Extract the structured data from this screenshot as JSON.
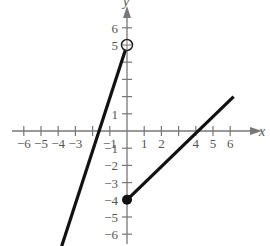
{
  "chart_data": {
    "type": "line",
    "title": "",
    "xlabel": "x",
    "ylabel": "y",
    "xlim": [
      -6.5,
      7
    ],
    "ylim": [
      -6.7,
      7
    ],
    "x_ticks": [
      -6,
      -5,
      -4,
      -3,
      -2,
      -1,
      1,
      2,
      3,
      4,
      5,
      6
    ],
    "x_tick_labels": [
      "-6",
      "-5",
      "-4",
      "-3",
      "",
      "-1",
      "1",
      "2",
      "",
      "4",
      "5",
      "6"
    ],
    "y_ticks": [
      -6,
      -5,
      -4,
      -3,
      -2,
      -1,
      1,
      2,
      3,
      4,
      5,
      6
    ],
    "y_tick_labels": [
      "-6",
      "-5",
      "-4",
      "-3",
      "-2",
      "-1",
      "1",
      "",
      "",
      "",
      "5",
      "6"
    ],
    "series": [
      {
        "name": "left piece",
        "x": [
          -3.8,
          0
        ],
        "y": [
          -6.7,
          5
        ],
        "start_marker": "none",
        "end_marker": "open-circle",
        "end_point": [
          0,
          5
        ]
      },
      {
        "name": "right piece",
        "x": [
          0,
          6.2
        ],
        "y": [
          -4,
          2
        ],
        "start_marker": "closed-dot",
        "start_point": [
          0,
          -4
        ],
        "end_marker": "none"
      }
    ],
    "grid": false,
    "legend": false
  },
  "labels": {
    "x_axis": "x",
    "y_axis": "y"
  }
}
